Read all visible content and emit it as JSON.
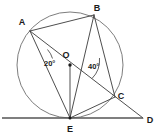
{
  "figure": {
    "canvas": {
      "width": 162,
      "height": 137
    },
    "background_color": "#ffffff",
    "line_color": "#3a3a3a",
    "circle_color": "#6e6e6e",
    "tangent_color": "#555555"
  },
  "circle": {
    "center_label": "O",
    "center_x": 70,
    "center_y": 65,
    "radius": 53
  },
  "points": [
    {
      "id": "A",
      "label": "A",
      "x": 30,
      "y": 31,
      "label_x": 22,
      "label_y": 25,
      "on_circle": true
    },
    {
      "id": "B",
      "label": "B",
      "x": 94,
      "y": 15,
      "label_x": 97,
      "label_y": 11,
      "on_circle": true
    },
    {
      "id": "C",
      "label": "C",
      "x": 115,
      "y": 97,
      "label_x": 121,
      "label_y": 99,
      "on_circle": true
    },
    {
      "id": "E",
      "label": "E",
      "x": 70,
      "y": 118,
      "label_x": 67,
      "label_y": 132,
      "on_circle": true
    },
    {
      "id": "O",
      "label": "O",
      "x": 70,
      "y": 65,
      "label_x": 66,
      "label_y": 58,
      "on_circle": false
    },
    {
      "id": "D",
      "label": "D",
      "x": 143,
      "y": 118,
      "label_x": 148,
      "label_y": 123,
      "on_circle": false
    }
  ],
  "segments": [
    {
      "name": "chord-A-B",
      "from": "A",
      "to": "B"
    },
    {
      "name": "chord-A-E",
      "from": "A",
      "to": "E"
    },
    {
      "name": "line-A-C-D",
      "from": "A",
      "to": "D"
    },
    {
      "name": "chord-B-E",
      "from": "B",
      "to": "E"
    },
    {
      "name": "chord-B-C",
      "from": "B",
      "to": "C"
    },
    {
      "name": "chord-C-E",
      "from": "C",
      "to": "E"
    },
    {
      "name": "radius-O-E",
      "from": "O",
      "to": "E"
    }
  ],
  "tangent": {
    "name": "tangent-line-at-E",
    "x1": 2,
    "y1": 118,
    "x2": 143,
    "y2": 118,
    "touch_point": "E",
    "end_label": "D"
  },
  "angles": [
    {
      "id": "angle-at-A",
      "value": "20°",
      "vertex": "A",
      "label_x": 44,
      "label_y": 63,
      "arc": "M 47.5 49.5 A 22 22 0 0 1 52.5 58.5"
    },
    {
      "id": "angle-at-C",
      "value": "40°",
      "vertex": "C",
      "label_x": 88,
      "label_y": 69,
      "arc": "M 92 78.5 A 26 26 0 0 0 99.5 58"
    }
  ]
}
